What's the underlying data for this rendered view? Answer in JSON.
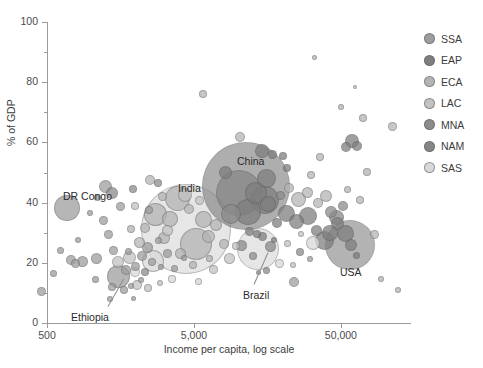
{
  "chart_data": {
    "type": "scatter",
    "title": "",
    "xlabel": "Income per capita, log scale",
    "ylabel": "% of GDP",
    "xscale": "log",
    "xlim": [
      500,
      150000
    ],
    "ylim": [
      0,
      100
    ],
    "grid": false,
    "x_ticks": [
      {
        "value": 500,
        "label": "500"
      },
      {
        "value": 5000,
        "label": "5,000"
      },
      {
        "value": 50000,
        "label": "50,000"
      }
    ],
    "y_ticks_major": [
      {
        "value": 0,
        "label": "0"
      },
      {
        "value": 20,
        "label": "20"
      },
      {
        "value": 40,
        "label": "40"
      },
      {
        "value": 60,
        "label": "60"
      },
      {
        "value": 80,
        "label": "80"
      },
      {
        "value": 100,
        "label": "100"
      }
    ],
    "y_ticks_minor": [
      10,
      30,
      50,
      70,
      90
    ],
    "legend_position": "right",
    "legend": [
      {
        "name": "SSA",
        "color": "#9d9d9d"
      },
      {
        "name": "EAP",
        "color": "#7e7e7e"
      },
      {
        "name": "ECA",
        "color": "#b4b4b4"
      },
      {
        "name": "LAC",
        "color": "#c2c2c2"
      },
      {
        "name": "MNA",
        "color": "#8b8b8b"
      },
      {
        "name": "NAM",
        "color": "#868686"
      },
      {
        "name": "SAS",
        "color": "#d8d8d8"
      }
    ],
    "size_encoding": "bubble area ~ total credit volume",
    "annotations": [
      {
        "label": "DR Congo",
        "x": 63,
        "y": 190,
        "leader": false
      },
      {
        "label": "India",
        "x": 178,
        "y": 182,
        "leader": false
      },
      {
        "label": "China",
        "x": 237,
        "y": 155,
        "leader": false
      },
      {
        "label": "USA",
        "x": 340,
        "y": 266,
        "leader": false
      },
      {
        "label": "Ethiopia",
        "x": 71,
        "y": 311,
        "leader": true,
        "lx1": 108,
        "ly1": 306,
        "lx2": 124,
        "ly2": 278
      },
      {
        "label": "Brazil",
        "x": 243,
        "y": 289,
        "leader": true,
        "lx1": 254,
        "ly1": 284,
        "lx2": 268,
        "ly2": 252
      }
    ],
    "points": [
      {
        "g": "SSA",
        "x": 41,
        "y": 291,
        "r": 4.5
      },
      {
        "g": "SSA",
        "x": 53,
        "y": 273,
        "r": 3.5
      },
      {
        "g": "SSA",
        "x": 71,
        "y": 260,
        "r": 5.0
      },
      {
        "g": "SSA",
        "x": 75,
        "y": 263,
        "r": 4.5
      },
      {
        "g": "SSA",
        "x": 82,
        "y": 261,
        "r": 5.5
      },
      {
        "g": "SSA",
        "x": 60,
        "y": 250,
        "r": 3.5
      },
      {
        "g": "SSA",
        "x": 78,
        "y": 240,
        "r": 3.0
      },
      {
        "g": "SSA",
        "x": 96,
        "y": 258,
        "r": 5.5
      },
      {
        "g": "SSA",
        "x": 67,
        "y": 208,
        "r": 13.0
      },
      {
        "g": "SSA",
        "x": 95,
        "y": 279,
        "r": 3.5
      },
      {
        "g": "SSA",
        "x": 108,
        "y": 234,
        "r": 4.5
      },
      {
        "g": "SSA",
        "x": 103,
        "y": 220,
        "r": 4.5
      },
      {
        "g": "SSA",
        "x": 97,
        "y": 197,
        "r": 3.5
      },
      {
        "g": "SSA",
        "x": 118,
        "y": 276,
        "r": 11.5
      },
      {
        "g": "SSA",
        "x": 126,
        "y": 270,
        "r": 5.0
      },
      {
        "g": "SSA",
        "x": 112,
        "y": 287,
        "r": 4.0
      },
      {
        "g": "SSA",
        "x": 124,
        "y": 290,
        "r": 4.0
      },
      {
        "g": "SSA",
        "x": 131,
        "y": 286,
        "r": 3.0
      },
      {
        "g": "SSA",
        "x": 105,
        "y": 186,
        "r": 6.5
      },
      {
        "g": "SSA",
        "x": 113,
        "y": 250,
        "r": 4.5
      },
      {
        "g": "SSA",
        "x": 128,
        "y": 251,
        "r": 3.5
      },
      {
        "g": "SSA",
        "x": 135,
        "y": 266,
        "r": 4.5
      },
      {
        "g": "SSA",
        "x": 141,
        "y": 280,
        "r": 3.0
      },
      {
        "g": "SSA",
        "x": 120,
        "y": 206,
        "r": 4.5
      },
      {
        "g": "SSA",
        "x": 142,
        "y": 256,
        "r": 5.0
      },
      {
        "g": "SSA",
        "x": 147,
        "y": 247,
        "r": 5.5
      },
      {
        "g": "SSA",
        "x": 152,
        "y": 262,
        "r": 4.0
      },
      {
        "g": "SSA",
        "x": 158,
        "y": 240,
        "r": 3.5
      },
      {
        "g": "SSA",
        "x": 149,
        "y": 210,
        "r": 4.0
      },
      {
        "g": "SSA",
        "x": 161,
        "y": 267,
        "r": 3.0
      },
      {
        "g": "SSA",
        "x": 167,
        "y": 253,
        "r": 4.5
      },
      {
        "g": "SSA",
        "x": 174,
        "y": 268,
        "r": 3.5
      },
      {
        "g": "SSA",
        "x": 184,
        "y": 258,
        "r": 3.0
      },
      {
        "g": "SSA",
        "x": 110,
        "y": 299,
        "r": 3.0
      },
      {
        "g": "SSA",
        "x": 133,
        "y": 298,
        "r": 2.5
      },
      {
        "g": "SSA",
        "x": 90,
        "y": 213,
        "r": 3.0
      },
      {
        "g": "SSA",
        "x": 294,
        "y": 282,
        "r": 5.0
      },
      {
        "g": "SSA",
        "x": 310,
        "y": 259,
        "r": 3.0
      },
      {
        "g": "SAS",
        "x": 186,
        "y": 229,
        "r": 45.0
      },
      {
        "g": "SAS",
        "x": 153,
        "y": 261,
        "r": 11.0
      },
      {
        "g": "SAS",
        "x": 258,
        "y": 249,
        "r": 21.0
      },
      {
        "g": "SAS",
        "x": 135,
        "y": 272,
        "r": 5.0
      },
      {
        "g": "SAS",
        "x": 172,
        "y": 279,
        "r": 4.0
      },
      {
        "g": "SAS",
        "x": 198,
        "y": 281,
        "r": 3.5
      },
      {
        "g": "SAS",
        "x": 279,
        "y": 263,
        "r": 4.5
      },
      {
        "g": "SAS",
        "x": 313,
        "y": 243,
        "r": 7.0
      },
      {
        "g": "EAP",
        "x": 246,
        "y": 186,
        "r": 44.0
      },
      {
        "g": "EAP",
        "x": 239,
        "y": 193,
        "r": 23.0
      },
      {
        "g": "EAP",
        "x": 256,
        "y": 193,
        "r": 11.0
      },
      {
        "g": "EAP",
        "x": 265,
        "y": 200,
        "r": 14.0
      },
      {
        "g": "EAP",
        "x": 248,
        "y": 212,
        "r": 13.0
      },
      {
        "g": "EAP",
        "x": 266,
        "y": 178,
        "r": 9.5
      },
      {
        "g": "EAP",
        "x": 268,
        "y": 204,
        "r": 8.0
      },
      {
        "g": "EAP",
        "x": 225,
        "y": 172,
        "r": 6.5
      },
      {
        "g": "EAP",
        "x": 262,
        "y": 151,
        "r": 7.0
      },
      {
        "g": "EAP",
        "x": 272,
        "y": 154,
        "r": 4.5
      },
      {
        "g": "EAP",
        "x": 283,
        "y": 156,
        "r": 4.0
      },
      {
        "g": "EAP",
        "x": 287,
        "y": 168,
        "r": 4.0
      },
      {
        "g": "EAP",
        "x": 249,
        "y": 231,
        "r": 4.5
      },
      {
        "g": "EAP",
        "x": 257,
        "y": 234,
        "r": 4.0
      },
      {
        "g": "EAP",
        "x": 262,
        "y": 236,
        "r": 4.5
      },
      {
        "g": "EAP",
        "x": 277,
        "y": 223,
        "r": 5.0
      },
      {
        "g": "EAP",
        "x": 286,
        "y": 213,
        "r": 8.5
      },
      {
        "g": "EAP",
        "x": 296,
        "y": 221,
        "r": 7.5
      },
      {
        "g": "EAP",
        "x": 308,
        "y": 216,
        "r": 9.0
      },
      {
        "g": "EAP",
        "x": 316,
        "y": 230,
        "r": 5.5
      },
      {
        "g": "EAP",
        "x": 324,
        "y": 240,
        "r": 9.5
      },
      {
        "g": "EAP",
        "x": 330,
        "y": 233,
        "r": 8.0
      },
      {
        "g": "EAP",
        "x": 337,
        "y": 223,
        "r": 6.5
      },
      {
        "g": "EAP",
        "x": 345,
        "y": 233,
        "r": 8.5
      },
      {
        "g": "EAP",
        "x": 346,
        "y": 147,
        "r": 5.0
      },
      {
        "g": "EAP",
        "x": 352,
        "y": 141,
        "r": 7.0
      },
      {
        "g": "EAP",
        "x": 357,
        "y": 146,
        "r": 5.0
      },
      {
        "g": "EAP",
        "x": 351,
        "y": 245,
        "r": 6.0
      },
      {
        "g": "EAP",
        "x": 356,
        "y": 255,
        "r": 3.5
      },
      {
        "g": "EAP",
        "x": 274,
        "y": 240,
        "r": 3.0
      },
      {
        "g": "ECA",
        "x": 155,
        "y": 214,
        "r": 11.5
      },
      {
        "g": "ECA",
        "x": 177,
        "y": 198,
        "r": 12.5
      },
      {
        "g": "ECA",
        "x": 170,
        "y": 219,
        "r": 8.0
      },
      {
        "g": "ECA",
        "x": 196,
        "y": 244,
        "r": 16.0
      },
      {
        "g": "ECA",
        "x": 203,
        "y": 219,
        "r": 8.5
      },
      {
        "g": "ECA",
        "x": 189,
        "y": 209,
        "r": 5.0
      },
      {
        "g": "ECA",
        "x": 208,
        "y": 236,
        "r": 6.5
      },
      {
        "g": "ECA",
        "x": 216,
        "y": 225,
        "r": 6.0
      },
      {
        "g": "ECA",
        "x": 224,
        "y": 244,
        "r": 5.0
      },
      {
        "g": "ECA",
        "x": 164,
        "y": 238,
        "r": 6.0
      },
      {
        "g": "ECA",
        "x": 180,
        "y": 253,
        "r": 5.5
      },
      {
        "g": "ECA",
        "x": 145,
        "y": 228,
        "r": 5.0
      },
      {
        "g": "ECA",
        "x": 139,
        "y": 242,
        "r": 5.5
      },
      {
        "g": "ECA",
        "x": 131,
        "y": 229,
        "r": 4.0
      },
      {
        "g": "ECA",
        "x": 162,
        "y": 196,
        "r": 4.5
      },
      {
        "g": "ECA",
        "x": 150,
        "y": 180,
        "r": 5.0
      },
      {
        "g": "ECA",
        "x": 193,
        "y": 265,
        "r": 4.0
      },
      {
        "g": "ECA",
        "x": 209,
        "y": 258,
        "r": 3.5
      },
      {
        "g": "ECA",
        "x": 298,
        "y": 199,
        "r": 7.5
      },
      {
        "g": "ECA",
        "x": 307,
        "y": 192,
        "r": 5.5
      },
      {
        "g": "ECA",
        "x": 289,
        "y": 188,
        "r": 5.0
      },
      {
        "g": "ECA",
        "x": 318,
        "y": 203,
        "r": 5.0
      },
      {
        "g": "ECA",
        "x": 326,
        "y": 196,
        "r": 6.0
      },
      {
        "g": "ECA",
        "x": 240,
        "y": 137,
        "r": 5.0
      },
      {
        "g": "ECA",
        "x": 311,
        "y": 175,
        "r": 4.0
      },
      {
        "g": "ECA",
        "x": 347,
        "y": 189,
        "r": 3.5
      },
      {
        "g": "ECA",
        "x": 360,
        "y": 200,
        "r": 4.0
      },
      {
        "g": "ECA",
        "x": 367,
        "y": 172,
        "r": 4.0
      },
      {
        "g": "ECA",
        "x": 374,
        "y": 234,
        "r": 4.5
      },
      {
        "g": "ECA",
        "x": 381,
        "y": 279,
        "r": 3.0
      },
      {
        "g": "ECA",
        "x": 398,
        "y": 290,
        "r": 3.0
      },
      {
        "g": "ECA",
        "x": 363,
        "y": 118,
        "r": 4.0
      },
      {
        "g": "ECA",
        "x": 392,
        "y": 126,
        "r": 4.5
      },
      {
        "g": "ECA",
        "x": 314,
        "y": 57,
        "r": 2.5
      },
      {
        "g": "ECA",
        "x": 203,
        "y": 94,
        "r": 4.0
      },
      {
        "g": "ECA",
        "x": 341,
        "y": 107,
        "r": 3.0
      },
      {
        "g": "ECA",
        "x": 320,
        "y": 157,
        "r": 4.0
      },
      {
        "g": "ECA",
        "x": 355,
        "y": 87,
        "r": 2.0
      },
      {
        "g": "LAC",
        "x": 118,
        "y": 262,
        "r": 6.0
      },
      {
        "g": "LAC",
        "x": 129,
        "y": 257,
        "r": 6.5
      },
      {
        "g": "LAC",
        "x": 137,
        "y": 285,
        "r": 5.0
      },
      {
        "g": "LAC",
        "x": 148,
        "y": 288,
        "r": 4.0
      },
      {
        "g": "LAC",
        "x": 160,
        "y": 283,
        "r": 3.0
      },
      {
        "g": "LAC",
        "x": 213,
        "y": 269,
        "r": 4.5
      },
      {
        "g": "LAC",
        "x": 229,
        "y": 258,
        "r": 5.5
      },
      {
        "g": "LAC",
        "x": 236,
        "y": 246,
        "r": 4.0
      },
      {
        "g": "LAC",
        "x": 167,
        "y": 230,
        "r": 5.5
      },
      {
        "g": "LAC",
        "x": 185,
        "y": 195,
        "r": 7.0
      },
      {
        "g": "LAC",
        "x": 199,
        "y": 200,
        "r": 4.5
      },
      {
        "g": "LAC",
        "x": 135,
        "y": 206,
        "r": 4.0
      },
      {
        "g": "LAC",
        "x": 287,
        "y": 243,
        "r": 3.5
      },
      {
        "g": "LAC",
        "x": 301,
        "y": 234,
        "r": 3.0
      },
      {
        "g": "LAC",
        "x": 293,
        "y": 265,
        "r": 3.0
      },
      {
        "g": "MNA",
        "x": 112,
        "y": 193,
        "r": 6.0
      },
      {
        "g": "MNA",
        "x": 133,
        "y": 189,
        "r": 4.0
      },
      {
        "g": "MNA",
        "x": 158,
        "y": 183,
        "r": 4.0
      },
      {
        "g": "MNA",
        "x": 145,
        "y": 272,
        "r": 4.0
      },
      {
        "g": "MNA",
        "x": 231,
        "y": 214,
        "r": 10.0
      },
      {
        "g": "MNA",
        "x": 241,
        "y": 245,
        "r": 5.5
      },
      {
        "g": "MNA",
        "x": 253,
        "y": 256,
        "r": 4.0
      },
      {
        "g": "MNA",
        "x": 270,
        "y": 246,
        "r": 5.5
      },
      {
        "g": "MNA",
        "x": 266,
        "y": 270,
        "r": 3.5
      },
      {
        "g": "MNA",
        "x": 300,
        "y": 252,
        "r": 4.0
      },
      {
        "g": "MNA",
        "x": 331,
        "y": 212,
        "r": 6.0
      },
      {
        "g": "MNA",
        "x": 343,
        "y": 206,
        "r": 5.0
      },
      {
        "g": "MNA",
        "x": 280,
        "y": 195,
        "r": 4.5
      },
      {
        "g": "MNA",
        "x": 258,
        "y": 272,
        "r": 2.5
      },
      {
        "g": "NAM",
        "x": 350,
        "y": 245,
        "r": 25.0
      },
      {
        "g": "NAM",
        "x": 336,
        "y": 217,
        "r": 7.5
      }
    ]
  }
}
